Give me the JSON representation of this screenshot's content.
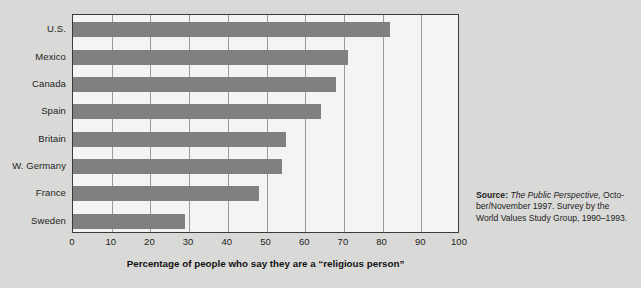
{
  "chart_data": {
    "type": "bar",
    "orientation": "horizontal",
    "title": "",
    "xlabel": "Percentage of people who say they are a “religious person”",
    "ylabel": "",
    "xlim": [
      0,
      100
    ],
    "xticks": [
      0,
      10,
      20,
      30,
      40,
      50,
      60,
      70,
      80,
      90,
      100
    ],
    "grid": true,
    "grid_axis": "x",
    "legend": false,
    "categories": [
      "U.S.",
      "Mexico",
      "Canada",
      "Spain",
      "Britain",
      "W. Germany",
      "France",
      "Sweden"
    ],
    "values": [
      82,
      71,
      68,
      64,
      55,
      54,
      48,
      29
    ],
    "bar_color": "#808080",
    "plot_background": "#f4f4f2",
    "page_background": "#d9d9d7",
    "axis_color": "#3a3a3a",
    "gridline_color": "#9a9a9a"
  },
  "axis_title": {
    "text": "Percentage of people who say they are a “religious person”"
  },
  "source": {
    "label": "Source:",
    "publication": "The Public Perspective,",
    "rest": " October-ber/November 1997. Survey by the World Values Study Group, 1990–1993.",
    "line1_after_pub": " Octo-",
    "line2": "ber/November 1997. Survey by the",
    "line3": "World Values Study Group, 1990–1993."
  },
  "title_remnant": {
    "text": ""
  }
}
